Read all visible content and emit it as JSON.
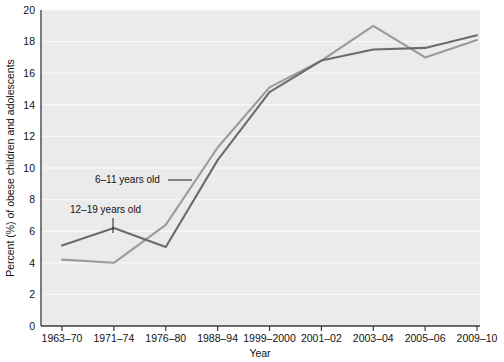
{
  "chart_data": {
    "type": "line",
    "title": "",
    "xlabel": "Year",
    "ylabel": "Percent (%) of obese children and adolescents",
    "categories": [
      "1963–70",
      "1971–74",
      "1976–80",
      "1988–94",
      "1999–2000",
      "2001–02",
      "2003–04",
      "2005–06",
      "2009–10"
    ],
    "ylim": [
      0,
      20
    ],
    "yticks": [
      0,
      2,
      4,
      6,
      8,
      10,
      12,
      14,
      16,
      18,
      20
    ],
    "ytick_labels": [
      "0",
      "2",
      "4",
      "6",
      "8",
      "10",
      "12",
      "14",
      "16",
      "18",
      "20"
    ],
    "grid": "horizontal",
    "legend_position": "inline-annotations",
    "series": [
      {
        "name": "6–11 years old",
        "color": "#9a9a9a",
        "values": [
          4.2,
          4.0,
          6.4,
          11.3,
          15.1,
          16.8,
          19.0,
          17.0,
          18.1
        ]
      },
      {
        "name": "12–19 years old",
        "color": "#6b6b6b",
        "values": [
          5.1,
          6.2,
          5.0,
          10.5,
          14.8,
          16.8,
          17.5,
          17.6,
          18.4
        ]
      }
    ],
    "annotations": [
      {
        "label": "6–11 years old",
        "series": "6–11 years old",
        "text_x": 95,
        "text_y": 183,
        "leader": {
          "x1": 168,
          "y1": 180,
          "x2": 192,
          "y2": 180
        }
      },
      {
        "label": "12–19 years old",
        "series": "12–19 years old",
        "text_x": 70,
        "text_y": 213,
        "leader": {
          "x1": 113,
          "y1": 218,
          "x2": 113,
          "y2": 233
        }
      }
    ]
  },
  "figure": {
    "background_color": "#ffffff",
    "plot_background_color": "#ebebeb",
    "gridline_color": "#f7f7f7",
    "axis_color": "#3a3a3a"
  }
}
